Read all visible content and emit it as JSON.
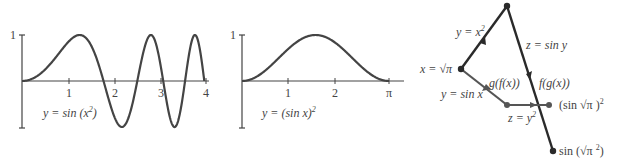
{
  "chart_data": [
    {
      "type": "line",
      "title": "",
      "label": "y = sin (x²)",
      "label_func": "y = sin (x",
      "label_exp": "2",
      "label_close": ")",
      "xlabel": "",
      "ylabel": "",
      "xlim": [
        0,
        4
      ],
      "ylim": [
        -1,
        1
      ],
      "x_ticks": [
        "1",
        "2",
        "3",
        "4"
      ],
      "y_ticks": [
        "1"
      ],
      "grid": false,
      "function": "sin(x^2)",
      "x": [
        0,
        0.5,
        1.0,
        1.2533,
        1.5,
        1.7725,
        2.0,
        2.1708,
        2.5066,
        2.8025,
        3.0,
        3.07,
        3.316,
        3.5449,
        3.7599,
        3.9633,
        4.0
      ],
      "values": [
        0,
        0.247,
        0.841,
        1.0,
        0.778,
        0.0,
        -0.757,
        -1.0,
        0.0,
        1.0,
        0.412,
        0.0,
        -1.0,
        0.0,
        1.0,
        0.0,
        -0.288
      ]
    },
    {
      "type": "line",
      "title": "",
      "label": "y = (sin x)²",
      "label_func": "y = (sin x)",
      "label_exp": "2",
      "xlabel": "",
      "ylabel": "",
      "xlim": [
        0,
        3.1416
      ],
      "ylim": [
        -1,
        1
      ],
      "x_ticks": [
        "1",
        "2",
        "π"
      ],
      "y_ticks": [
        "1"
      ],
      "grid": false,
      "function": "(sin x)^2",
      "x": [
        0,
        0.5,
        1.0,
        1.5708,
        2.0,
        2.5,
        3.1416
      ],
      "values": [
        0,
        0.23,
        0.708,
        1.0,
        0.827,
        0.358,
        0
      ]
    }
  ],
  "diagram": {
    "start_label": "x = √π",
    "upper_edge1": "y = x",
    "upper_edge1_exp": "2",
    "upper_edge2": "z = sin y",
    "lower_edge1": "y = sin x",
    "lower_edge2": "z = y",
    "lower_edge2_exp": "2",
    "composite_gf": "g(f(x))",
    "composite_fg": "f(g(x))",
    "result_lower": "(sin √π )",
    "result_lower_exp": "2",
    "result_upper": "sin (√π ",
    "result_upper_exp": "2",
    "result_upper_close": ")"
  },
  "colors": {
    "dark_path": "#2a2a2a",
    "gray_path": "#5a5a5a",
    "axis": "#444444",
    "text": "#444444"
  }
}
